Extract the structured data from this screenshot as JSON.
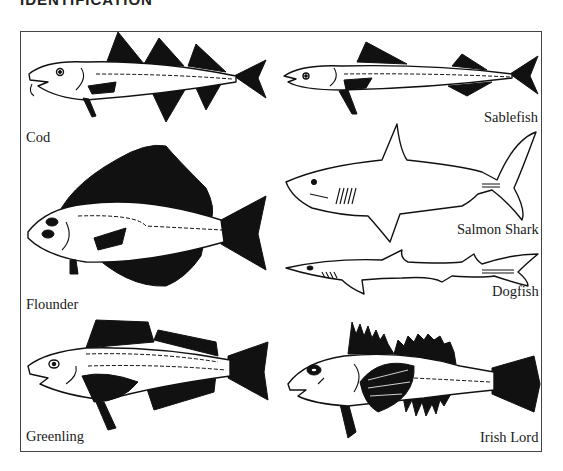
{
  "page": {
    "heading": "IDENTIFICATION"
  },
  "colors": {
    "ink": "#111111",
    "background": "#ffffff",
    "frame": "#444444"
  },
  "fish": [
    {
      "id": "cod",
      "label": "Cod",
      "column": "left",
      "row": 1
    },
    {
      "id": "sablefish",
      "label": "Sablefish",
      "column": "right",
      "row": 1
    },
    {
      "id": "flounder",
      "label": "Flounder",
      "column": "left",
      "row": 2
    },
    {
      "id": "salmon-shark",
      "label": "Salmon Shark",
      "column": "right",
      "row": 2
    },
    {
      "id": "dogfish",
      "label": "Dogfish",
      "column": "right",
      "row": 3
    },
    {
      "id": "greenling",
      "label": "Greenling",
      "column": "left",
      "row": 3
    },
    {
      "id": "irish-lord",
      "label": "Irish Lord",
      "column": "right",
      "row": 4
    }
  ]
}
